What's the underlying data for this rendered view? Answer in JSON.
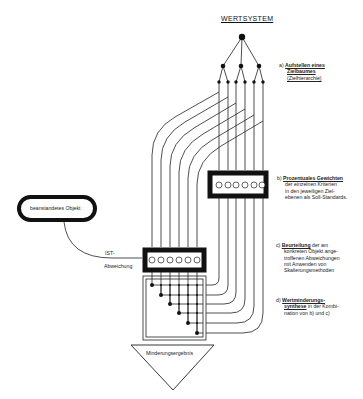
{
  "title": "WERTSYSTEM",
  "object_label": "beanstandetes Objekt",
  "ist_label": "IST-",
  "abweichung_label": "Abweichung",
  "result_label": "Minderungsergebnis",
  "steps": [
    {
      "letter": "a)",
      "heading": "Aufstellen eines",
      "heading2": "Zielbaumes",
      "text": "(Zielhierarchie)"
    },
    {
      "letter": "b)",
      "heading": "Prozentuales Gewichten",
      "text1": "der einzelnen Kriterien",
      "text2": "in den jeweiligen Ziel-",
      "text3": "ebenen als Soll-Standards."
    },
    {
      "letter": "c)",
      "heading": "Beurteilung",
      "rest": " der am",
      "text1": "konkreten Objekt ange-",
      "text2": "troffenen Abweichungen",
      "text3": "mit Anwenden von",
      "text4": "Skalierungsmethoden"
    },
    {
      "letter": "d)",
      "heading": "Wertminderungs-",
      "heading2": "synthese",
      "rest": " in der Kombi-",
      "text1": "nation von b) und c)"
    }
  ],
  "colors": {
    "ink": "#111111",
    "background": "#ffffff"
  }
}
